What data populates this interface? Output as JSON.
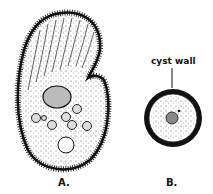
{
  "figure": {
    "panel_a": {
      "label": "A."
    },
    "panel_b": {
      "label": "B.",
      "annotation": "cyst wall"
    }
  },
  "colors": {
    "ink": "#111111",
    "stipple": "#444444",
    "nucleus_fill": "#888888",
    "background": "#ffffff"
  }
}
